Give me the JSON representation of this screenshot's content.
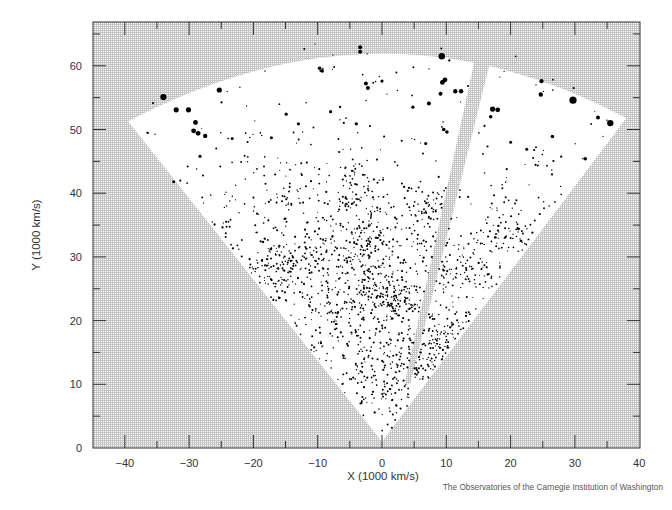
{
  "chart_data": {
    "type": "scatter",
    "title": "",
    "xlabel": "X (1000 km/s)",
    "ylabel": "Y (1000 km/s)",
    "xlim": [
      -45,
      40
    ],
    "ylim": [
      0,
      66
    ],
    "x_ticks": [
      -40,
      -30,
      -20,
      -10,
      0,
      10,
      20,
      30,
      40
    ],
    "y_ticks": [
      0,
      10,
      20,
      30,
      40,
      50,
      60
    ],
    "x_minor_step": 5,
    "y_minor_step": 5,
    "grid": false,
    "legend": null,
    "survey_region": {
      "shape": "fan/wedge",
      "apex": [
        0,
        1
      ],
      "left_corner": [
        -39.5,
        51.3
      ],
      "right_corner": [
        38.0,
        51.8
      ],
      "top_arc_y_at_x0": 65.3,
      "gap_stripe": {
        "bottom": [
          3.5,
          10
        ],
        "top_left": [
          14.9,
          63.2
        ],
        "top_right": [
          17.4,
          63.0
        ],
        "bottom_width": 0.9
      }
    },
    "bright_points": [
      {
        "x": 9.3,
        "y": 61.5,
        "size": 3.2
      },
      {
        "x": 29.7,
        "y": 54.6,
        "size": 3.6
      },
      {
        "x": 35.5,
        "y": 51.0,
        "size": 3.2
      },
      {
        "x": -34.0,
        "y": 55.1,
        "size": 3.1
      },
      {
        "x": -25.3,
        "y": 56.2,
        "size": 2.6
      },
      {
        "x": -32.0,
        "y": 53.1,
        "size": 2.6
      },
      {
        "x": -30.1,
        "y": 53.1,
        "size": 2.6
      },
      {
        "x": -29.0,
        "y": 51.1,
        "size": 2.4
      },
      {
        "x": -29.3,
        "y": 49.8,
        "size": 2.4
      },
      {
        "x": -28.6,
        "y": 49.4,
        "size": 2.4
      },
      {
        "x": -27.5,
        "y": 49.0,
        "size": 2.2
      },
      {
        "x": 17.2,
        "y": 53.2,
        "size": 2.6
      },
      {
        "x": 18.0,
        "y": 53.1,
        "size": 2.4
      },
      {
        "x": 24.8,
        "y": 57.6,
        "size": 2.2
      },
      {
        "x": 24.7,
        "y": 55.5,
        "size": 2.2
      },
      {
        "x": 9.8,
        "y": 57.8,
        "size": 2.4
      },
      {
        "x": 9.4,
        "y": 57.4,
        "size": 2.4
      },
      {
        "x": 12.3,
        "y": 56.0,
        "size": 2.2
      },
      {
        "x": 11.4,
        "y": 56.0,
        "size": 2.2
      },
      {
        "x": 9.1,
        "y": 55.6,
        "size": 2.0
      },
      {
        "x": 7.3,
        "y": 54.1,
        "size": 2.0
      },
      {
        "x": -3.4,
        "y": 62.9,
        "size": 2.0
      },
      {
        "x": -3.4,
        "y": 62.2,
        "size": 2.0
      },
      {
        "x": -2.5,
        "y": 57.2,
        "size": 2.0
      },
      {
        "x": -2.2,
        "y": 56.5,
        "size": 2.0
      },
      {
        "x": 33.6,
        "y": 51.9,
        "size": 2.0
      },
      {
        "x": 26.5,
        "y": 48.9,
        "size": 1.8
      },
      {
        "x": 31.6,
        "y": 45.4,
        "size": 1.8
      },
      {
        "x": 16.9,
        "y": 52.0,
        "size": 1.8
      },
      {
        "x": 9.6,
        "y": 50.0,
        "size": 1.8
      },
      {
        "x": 10.1,
        "y": 49.6,
        "size": 1.8
      },
      {
        "x": -9.7,
        "y": 59.6,
        "size": 1.8
      },
      {
        "x": -9.3,
        "y": 59.2,
        "size": 1.8
      },
      {
        "x": 0.0,
        "y": 57.6,
        "size": 1.6
      },
      {
        "x": -14.9,
        "y": 52.4,
        "size": 1.6
      },
      {
        "x": -13.0,
        "y": 50.9,
        "size": 1.6
      },
      {
        "x": -8.0,
        "y": 52.8,
        "size": 1.6
      },
      {
        "x": -4.0,
        "y": 50.9,
        "size": 1.6
      },
      {
        "x": 4.8,
        "y": 53.5,
        "size": 1.6
      },
      {
        "x": 6.8,
        "y": 47.8,
        "size": 1.6
      },
      {
        "x": -28.3,
        "y": 45.8,
        "size": 1.6
      },
      {
        "x": -32.4,
        "y": 41.8,
        "size": 1.5
      },
      {
        "x": -17.2,
        "y": 48.7,
        "size": 1.5
      },
      {
        "x": -23.3,
        "y": 48.6,
        "size": 1.5
      },
      {
        "x": 20.0,
        "y": 48.0,
        "size": 1.5
      },
      {
        "x": 22.5,
        "y": 46.9,
        "size": 1.5
      }
    ],
    "field_points": {
      "description": "~1800 fainter galaxies distributed through the fan, denser toward the center (15-35) with filamentary clusters",
      "count": 1750,
      "seed": 7,
      "clusters": [
        {
          "x": 0,
          "y": 25,
          "sx": 3.5,
          "sy": 3,
          "n": 160
        },
        {
          "x": -3,
          "y": 33,
          "sx": 3,
          "sy": 2.5,
          "n": 110
        },
        {
          "x": -12,
          "y": 30,
          "sx": 4,
          "sy": 3,
          "n": 110
        },
        {
          "x": -17,
          "y": 27,
          "sx": 2.5,
          "sy": 2.5,
          "n": 80
        },
        {
          "x": 3,
          "y": 23.5,
          "sx": 2,
          "sy": 1.5,
          "n": 60
        },
        {
          "x": 8,
          "y": 17,
          "sx": 2.5,
          "sy": 2,
          "n": 80
        },
        {
          "x": 6,
          "y": 13,
          "sx": 2.5,
          "sy": 2,
          "n": 60
        },
        {
          "x": 12,
          "y": 28,
          "sx": 3,
          "sy": 3,
          "n": 70
        },
        {
          "x": 19.5,
          "y": 33.5,
          "sx": 1.5,
          "sy": 1.2,
          "n": 40
        },
        {
          "x": 7,
          "y": 38,
          "sx": 2,
          "sy": 2,
          "n": 50
        },
        {
          "x": -6,
          "y": 21,
          "sx": 3,
          "sy": 2.5,
          "n": 80
        },
        {
          "x": -2,
          "y": 14,
          "sx": 2.5,
          "sy": 3,
          "n": 70
        },
        {
          "x": -4,
          "y": 40,
          "sx": 3,
          "sy": 2.5,
          "n": 60
        },
        {
          "x": -14,
          "y": 42,
          "sx": 4,
          "sy": 3,
          "n": 40
        },
        {
          "x": 2,
          "y": 8,
          "sx": 1.5,
          "sy": 2,
          "n": 30
        }
      ]
    }
  },
  "axes": {
    "x_label": "X (1000 km/s)",
    "y_label": "Y (1000 km/s)",
    "x_tick_labels": [
      "−40",
      "−30",
      "−20",
      "−10",
      "0",
      "10",
      "20",
      "30",
      "40"
    ],
    "y_tick_labels": [
      "0",
      "10",
      "20",
      "30",
      "40",
      "50",
      "60"
    ]
  },
  "credit": "The Observatories of the Carnegie Institution of Washington",
  "colors": {
    "background_pattern": "#b8b8b8",
    "survey_region": "#ffffff",
    "points": "#000000",
    "frame": "#333333"
  }
}
